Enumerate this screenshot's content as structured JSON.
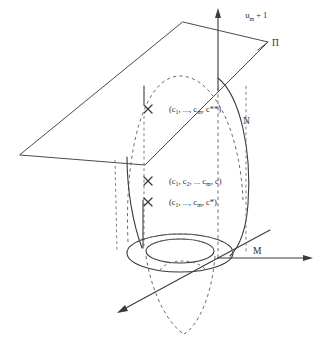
{
  "figure": {
    "background_color": "#ffffff",
    "line_color": "#4a4a4a",
    "text_color": "#2e2e2e"
  },
  "axes": {
    "vertical": {
      "label_main": "u",
      "label_subscript": "m",
      "label_suffix": " + 1",
      "full_label": "uₘ + 1",
      "direction": "up",
      "arrow": "arrow-up"
    },
    "horizontal_right": {
      "label": "",
      "direction": "right",
      "arrow": "arrow-right"
    },
    "depth_front": {
      "label": "",
      "direction": "down-left",
      "arrow": "arrow-down-left"
    }
  },
  "labels": {
    "plane": "П",
    "surface": "N",
    "manifold": "M",
    "point_upper": "(c₁, ..., cₘ, c**)",
    "point_middle": "(c₁, c₂, ... cₘ, c)",
    "point_lower": "(c₁, ..., cₘ, c*)"
  },
  "point_label_parts": {
    "upper": {
      "p1": "(c",
      "s1": "1",
      "p2": ", ..., c",
      "s2": "m",
      "p3": ", c**)"
    },
    "middle": {
      "p1": "(c",
      "s1": "1",
      "p2": ", c",
      "s2": "2",
      "p3": ", ... c",
      "s3": "m",
      "p4": ", c)"
    },
    "lower": {
      "p1": "(c",
      "s1": "1",
      "p2": ", ..., c",
      "s2": "m",
      "p3": ", c*)"
    }
  },
  "markers": [
    {
      "name": "point-upper",
      "x": 148,
      "y": 109
    },
    {
      "name": "point-middle",
      "x": 148,
      "y": 181
    },
    {
      "name": "point-lower",
      "x": 148,
      "y": 202
    }
  ],
  "elements": {
    "plane_name": "plane-pi-parallelogram",
    "surface_name": "surface-n-dome",
    "annulus_name": "manifold-m-annulus",
    "cone_name": "dashed-cone-below"
  }
}
